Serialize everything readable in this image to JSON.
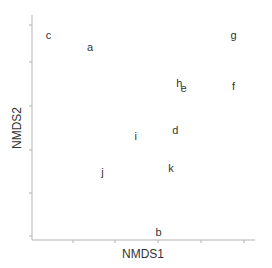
{
  "chart_data": {
    "type": "scatter",
    "title": "",
    "xlabel": "NMDS1",
    "ylabel": "NMDS2",
    "grid": false,
    "legend": null,
    "axis_tick_labels_shown": false,
    "x_tick_count": 5,
    "y_tick_count": 6,
    "marker_style": "text-label",
    "points": [
      {
        "label": "c",
        "x": 0.05,
        "y": 0.95
      },
      {
        "label": "a",
        "x": 0.25,
        "y": 0.89
      },
      {
        "label": "g",
        "x": 0.94,
        "y": 0.95
      },
      {
        "label": "h",
        "x": 0.68,
        "y": 0.72
      },
      {
        "label": "e",
        "x": 0.7,
        "y": 0.7
      },
      {
        "label": "f",
        "x": 0.94,
        "y": 0.71
      },
      {
        "label": "i",
        "x": 0.47,
        "y": 0.47
      },
      {
        "label": "d",
        "x": 0.66,
        "y": 0.5
      },
      {
        "label": "j",
        "x": 0.31,
        "y": 0.3
      },
      {
        "label": "k",
        "x": 0.64,
        "y": 0.32
      },
      {
        "label": "b",
        "x": 0.58,
        "y": 0.02
      }
    ],
    "xlim": [
      0,
      1
    ],
    "ylim": [
      0,
      1
    ]
  },
  "colors": {
    "axis": "#b3b3b3",
    "text": "#333333",
    "background": "#ffffff"
  }
}
